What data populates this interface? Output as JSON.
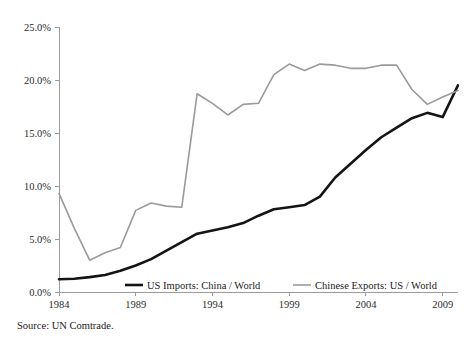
{
  "chart_data": {
    "type": "line",
    "title": "",
    "subtitle": "",
    "xlabel": "",
    "ylabel": "",
    "xlim": [
      1984,
      2010
    ],
    "ylim": [
      0.0,
      25.0
    ],
    "grid": false,
    "legend_position": "bottom-inside",
    "x_tick_labels": [
      "1984",
      "1989",
      "1994",
      "1999",
      "2004",
      "2009"
    ],
    "x_ticks": [
      1984,
      1989,
      1994,
      1999,
      2004,
      2009
    ],
    "y_tick_labels": [
      "0.0%",
      "5.0%",
      "10.0%",
      "15.0%",
      "20.0%",
      "25.0%"
    ],
    "y_ticks": [
      0.0,
      5.0,
      10.0,
      15.0,
      20.0,
      25.0
    ],
    "x": [
      1984,
      1985,
      1986,
      1987,
      1988,
      1989,
      1990,
      1991,
      1992,
      1993,
      1994,
      1995,
      1996,
      1997,
      1998,
      1999,
      2000,
      2001,
      2002,
      2003,
      2004,
      2005,
      2006,
      2007,
      2008,
      2009,
      2010
    ],
    "series": [
      {
        "name": "US Imports: China / World",
        "color": "#141414",
        "width": 2.6,
        "values": [
          1.2,
          1.25,
          1.4,
          1.6,
          2.0,
          2.5,
          3.1,
          3.9,
          4.7,
          5.5,
          5.8,
          6.1,
          6.5,
          7.2,
          7.8,
          8.0,
          8.2,
          9.0,
          10.8,
          12.1,
          13.4,
          14.6,
          15.5,
          16.4,
          16.9,
          16.5,
          19.5
        ]
      },
      {
        "name": "Chinese Exports: US / World",
        "color": "#9a9a9a",
        "width": 1.6,
        "values": [
          9.3,
          6.0,
          3.0,
          3.7,
          4.2,
          7.7,
          8.4,
          8.1,
          8.0,
          18.7,
          17.8,
          16.7,
          17.7,
          17.8,
          20.5,
          21.5,
          20.9,
          21.5,
          21.4,
          21.1,
          21.1,
          21.4,
          21.4,
          19.1,
          17.7,
          18.4,
          19.0
        ]
      }
    ]
  },
  "legend": {
    "items": [
      {
        "label": "US Imports: China / World",
        "color": "#141414"
      },
      {
        "label": "Chinese Exports: US / World",
        "color": "#9a9a9a"
      }
    ]
  },
  "source": {
    "text": "Source: UN Comtrade."
  }
}
